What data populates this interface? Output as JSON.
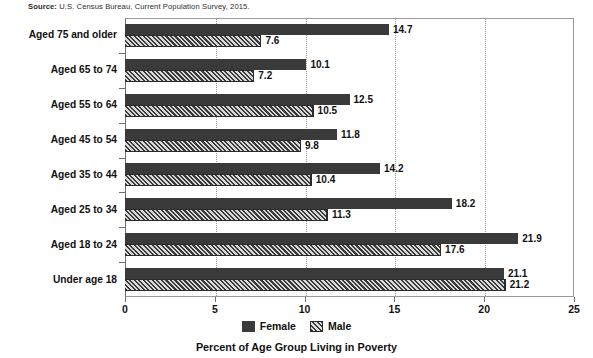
{
  "source_note": {
    "label": "Source:",
    "text": " U.S. Census Bureau, Current Population Survey, 2015."
  },
  "chart_data": {
    "type": "bar",
    "orientation": "horizontal",
    "title": "",
    "xlabel": "Percent of Age Group Living in Poverty",
    "ylabel": "",
    "xlim": [
      0,
      25
    ],
    "xticks": [
      "0",
      "5",
      "10",
      "15",
      "20",
      "25"
    ],
    "grid": "vertical dotted gridlines at 5, 10, 15, 20",
    "legend_position": "bottom-center",
    "categories": [
      "Aged 75 and older",
      "Aged 65 to 74",
      "Aged 55 to 64",
      "Aged 45 to 54",
      "Aged 35 to 44",
      "Aged 25 to 34",
      "Aged 18 to 24",
      "Under age 18"
    ],
    "series": [
      {
        "name": "Female",
        "pattern": "solid",
        "color": "#3a3a3a",
        "values": [
          14.7,
          10.1,
          12.5,
          11.8,
          14.2,
          18.2,
          21.9,
          21.1
        ],
        "labels": [
          "14.7",
          "10.1",
          "12.5",
          "11.8",
          "14.2",
          "18.2",
          "21.9",
          "21.1"
        ]
      },
      {
        "name": "Male",
        "pattern": "diagonal-hatch",
        "color": "#3a3a3a",
        "values": [
          7.6,
          7.2,
          10.5,
          9.8,
          10.4,
          11.3,
          17.6,
          21.2
        ],
        "labels": [
          "7.6",
          "7.2",
          "10.5",
          "9.8",
          "10.4",
          "11.3",
          "17.6",
          "21.2"
        ]
      }
    ]
  }
}
